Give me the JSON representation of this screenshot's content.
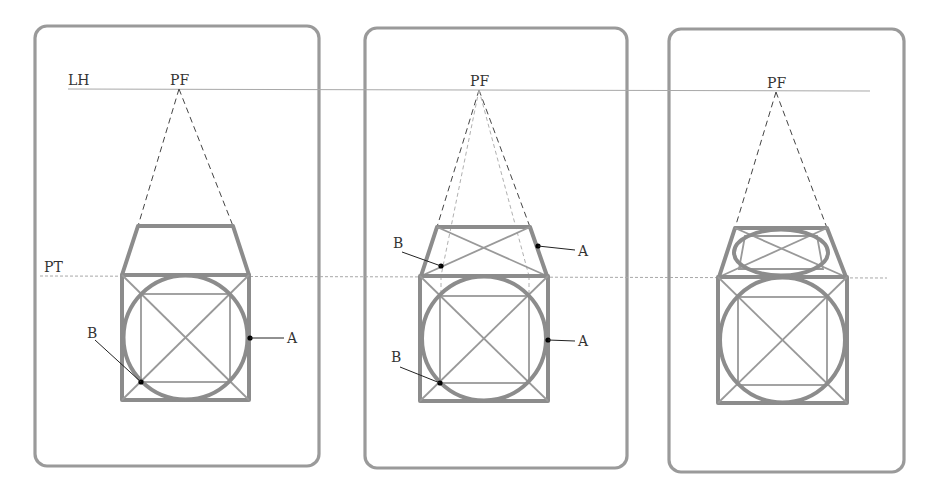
{
  "figure": {
    "line_labels": {
      "horizon": "LH",
      "ground": "PT",
      "vanishing_point": "PF"
    },
    "panels": [
      {
        "index": 1,
        "vanishing_point_label": "PF",
        "point_labels": [
          "A",
          "B"
        ],
        "step": "Front face square with inscribed circle; top face trapezoid drawn toward PF"
      },
      {
        "index": 2,
        "vanishing_point_label": "PF",
        "point_labels_top": [
          "A",
          "B"
        ],
        "point_labels_front": [
          "A",
          "B"
        ],
        "step": "Diagonals in top face; tangent points A and B projected to top face"
      },
      {
        "index": 3,
        "vanishing_point_label": "PF",
        "step": "Ellipse drawn in top face completing the cylinder"
      }
    ],
    "colors": {
      "panel_border": "#9a9a9a",
      "shape_stroke": "#8c8c8c",
      "guide_stroke": "#999999",
      "dashed_projection": "#444444",
      "point_marker": "#000000"
    }
  }
}
